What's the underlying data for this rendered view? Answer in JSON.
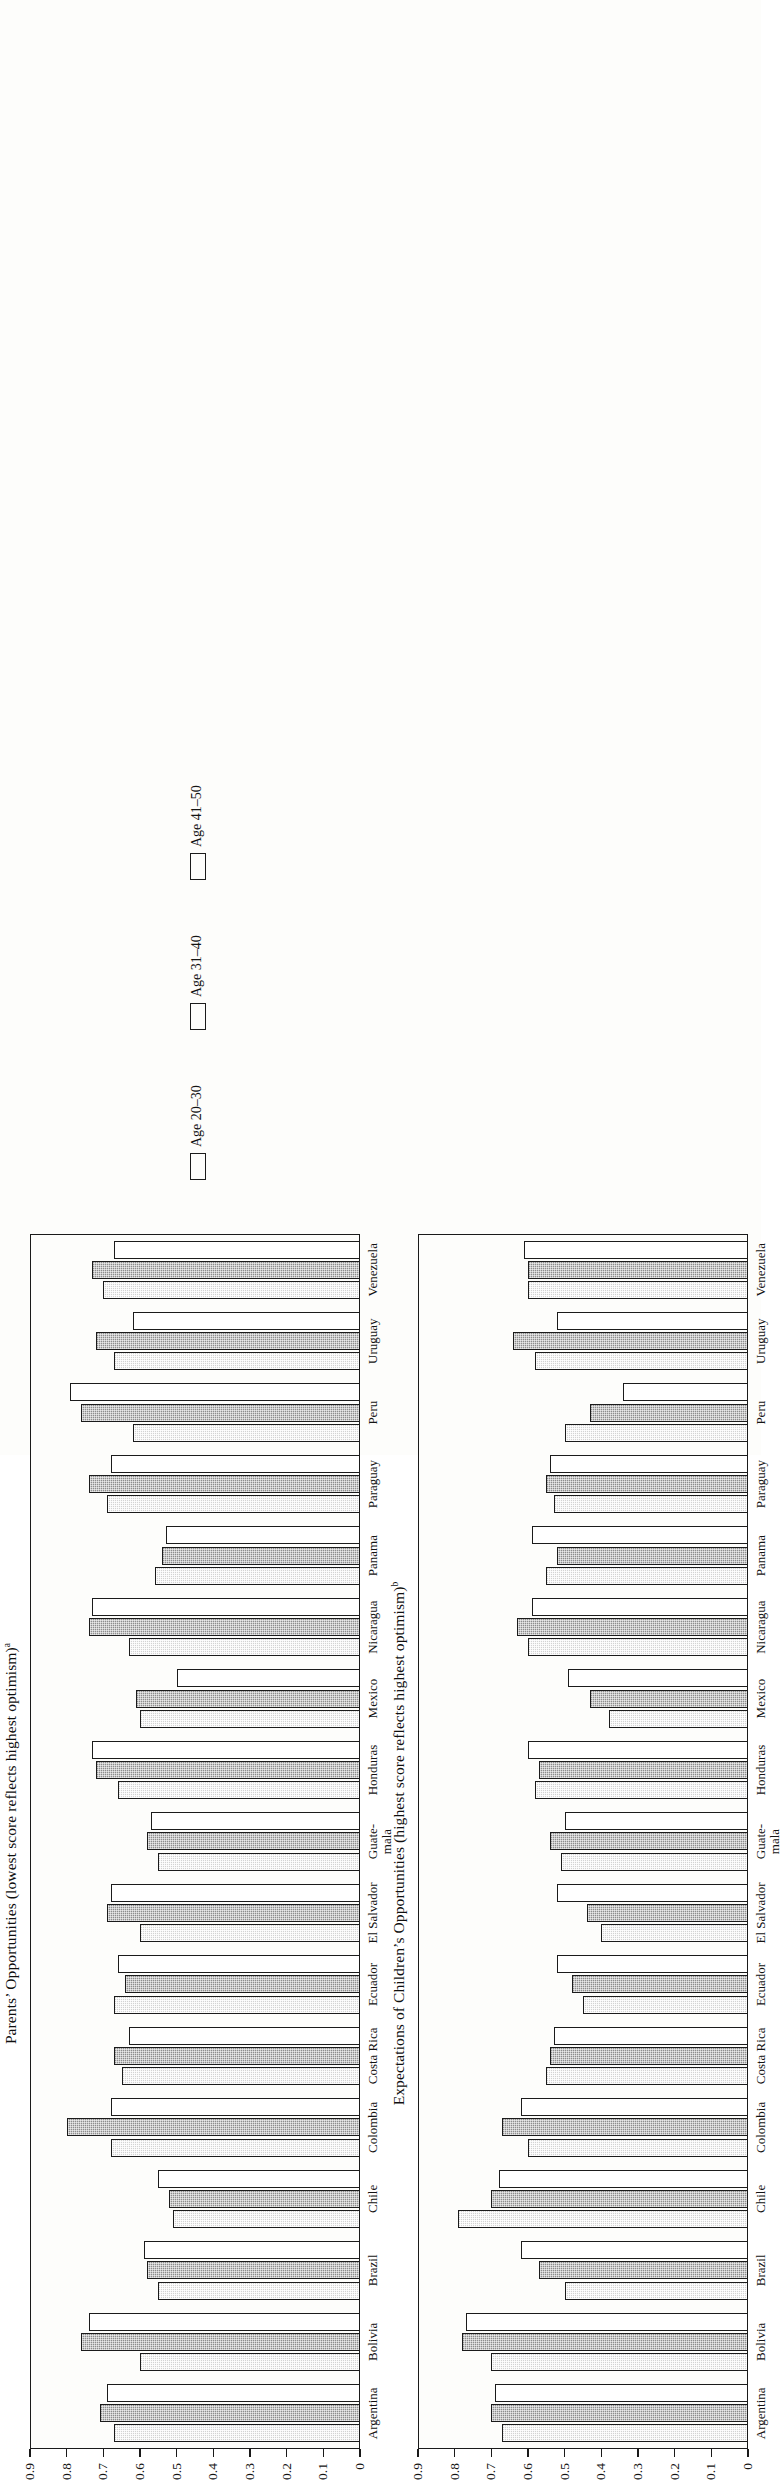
{
  "figure": {
    "orientation": "rotated-90-ccw",
    "y_axis_label": "Level of optimism",
    "tick_labels": [
      "0.9",
      "0.8",
      "0.7",
      "0.6",
      "0.5",
      "0.4",
      "0.3",
      "0.2",
      "0.1",
      "0"
    ],
    "categories": [
      "Argentina",
      "Bolivia",
      "Brazil",
      "Chile",
      "Colombia",
      "Costa Rica",
      "Ecuador",
      "El Salvador",
      "Guate-\nmala",
      "Honduras",
      "Mexico",
      "Nicaragua",
      "Panama",
      "Paraguay",
      "Peru",
      "Uruguay",
      "Venezuela"
    ],
    "legend": {
      "items": [
        {
          "label": "Age 20–30",
          "swatch": "light-stipple"
        },
        {
          "label": "Age 31–40",
          "swatch": "dark-stipple"
        },
        {
          "label": "Age 41–50",
          "swatch": "white"
        }
      ]
    },
    "colors": {
      "series_light": "#d3d3d3",
      "series_dark": "#8d8d8d",
      "series_white": "#ffffff",
      "outline": "#1b1b1b"
    }
  },
  "chart_data": [
    {
      "type": "bar",
      "id": "parents-opportunities",
      "title": "Parents’ Opportunities (lowest score reflects highest optimism)",
      "title_superscript": "a",
      "ylabel": "Level of optimism",
      "xlabel": "",
      "ylim": [
        0,
        0.9
      ],
      "yticks": [
        0,
        0.1,
        0.2,
        0.3,
        0.4,
        0.5,
        0.6,
        0.7,
        0.8,
        0.9
      ],
      "grid": false,
      "legend_position": "below-axis",
      "categories": [
        "Argentina",
        "Bolivia",
        "Brazil",
        "Chile",
        "Colombia",
        "Costa Rica",
        "Ecuador",
        "El Salvador",
        "Guate-mala",
        "Honduras",
        "Mexico",
        "Nicaragua",
        "Panama",
        "Paraguay",
        "Peru",
        "Uruguay",
        "Venezuela"
      ],
      "series": [
        {
          "name": "Age 20–30",
          "values": [
            0.67,
            0.6,
            0.55,
            0.51,
            0.68,
            0.65,
            0.67,
            0.6,
            0.55,
            0.66,
            0.6,
            0.63,
            0.56,
            0.69,
            0.62,
            0.67,
            0.7
          ]
        },
        {
          "name": "Age 31–40",
          "values": [
            0.71,
            0.76,
            0.58,
            0.52,
            0.8,
            0.67,
            0.64,
            0.69,
            0.58,
            0.72,
            0.61,
            0.74,
            0.54,
            0.74,
            0.76,
            0.72,
            0.73
          ]
        },
        {
          "name": "Age 41–50",
          "values": [
            0.69,
            0.74,
            0.59,
            0.55,
            0.68,
            0.63,
            0.66,
            0.68,
            0.57,
            0.73,
            0.5,
            0.73,
            0.53,
            0.68,
            0.79,
            0.62,
            0.67
          ]
        }
      ]
    },
    {
      "type": "bar",
      "id": "expectations-children-opportunities",
      "title": "Expectations of Children’s Opportunities (highest score reflects highest optimism)",
      "title_superscript": "b",
      "ylabel": "Level of optimism",
      "xlabel": "",
      "ylim": [
        0,
        0.9
      ],
      "yticks": [
        0,
        0.1,
        0.2,
        0.3,
        0.4,
        0.5,
        0.6,
        0.7,
        0.8,
        0.9
      ],
      "grid": false,
      "legend_position": "shared-above",
      "categories": [
        "Argentina",
        "Bolivia",
        "Brazil",
        "Chile",
        "Colombia",
        "Costa Rica",
        "Ecuador",
        "El Salvador",
        "Guate-mala",
        "Honduras",
        "Mexico",
        "Nicaragua",
        "Panama",
        "Paraguay",
        "Peru",
        "Uruguay",
        "Venezuela"
      ],
      "series": [
        {
          "name": "Age 20–30",
          "values": [
            0.67,
            0.7,
            0.5,
            0.79,
            0.6,
            0.55,
            0.45,
            0.4,
            0.51,
            0.58,
            0.38,
            0.6,
            0.55,
            0.53,
            0.5,
            0.58,
            0.6
          ]
        },
        {
          "name": "Age 31–40",
          "values": [
            0.7,
            0.78,
            0.57,
            0.7,
            0.67,
            0.54,
            0.48,
            0.44,
            0.54,
            0.57,
            0.43,
            0.63,
            0.52,
            0.55,
            0.43,
            0.64,
            0.6
          ]
        },
        {
          "name": "Age 41–50",
          "values": [
            0.69,
            0.77,
            0.62,
            0.68,
            0.62,
            0.53,
            0.52,
            0.52,
            0.5,
            0.6,
            0.49,
            0.59,
            0.59,
            0.54,
            0.34,
            0.52,
            0.61
          ]
        }
      ]
    }
  ]
}
